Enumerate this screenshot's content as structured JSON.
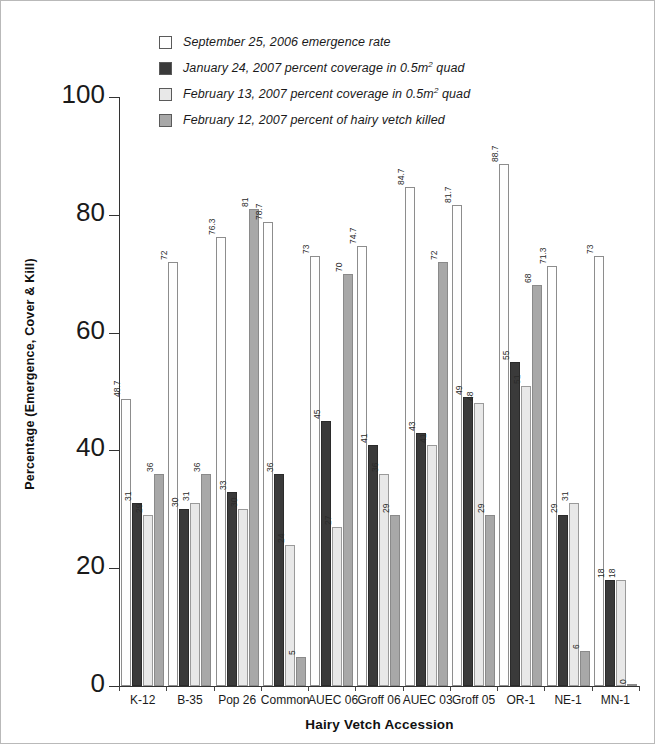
{
  "chart_data": {
    "type": "bar",
    "title": "",
    "xlabel": "Hairy Vetch Accession",
    "ylabel": "Percentage (Emergence, Cover & Kill)",
    "ylim": [
      0,
      100
    ],
    "yticks": [
      0,
      20,
      40,
      60,
      80,
      100
    ],
    "grid": false,
    "legend_position": "top-left",
    "categories": [
      "K-12",
      "B-35",
      "Pop 26",
      "Common",
      "AUEC 06",
      "Groff 06",
      "AUEC 03",
      "Groff 05",
      "OR-1",
      "NE-1",
      "MN-1"
    ],
    "series": [
      {
        "name": "September 25, 2006 emergence rate",
        "color": "#fefefe",
        "values": [
          48.7,
          72,
          76.3,
          78.7,
          73,
          74.7,
          84.7,
          81.7,
          88.7,
          71.3,
          73
        ],
        "labels": [
          "48.7",
          "72",
          "76.3",
          "78.7",
          "73",
          "74.7",
          "84.7",
          "81.7",
          "88.7",
          "71.3",
          "73"
        ]
      },
      {
        "name": "January 24, 2007 percent coverage in 0.5m2 quad",
        "color": "#3a3a3a",
        "values": [
          31,
          30,
          33,
          36,
          45,
          41,
          43,
          49,
          55,
          29,
          18
        ],
        "labels": [
          "31",
          "30",
          "33",
          "36",
          "45",
          "41",
          "43",
          "49",
          "55",
          "29",
          "18"
        ]
      },
      {
        "name": "February 13, 2007 percent coverage in 0.5m2 quad",
        "color": "#e8e8e8",
        "values": [
          29,
          31,
          30,
          24,
          27,
          36,
          41,
          48,
          51,
          31,
          18
        ],
        "labels": [
          "29",
          "31",
          "30",
          "24",
          "27",
          "36",
          "41",
          "48",
          "51",
          "31",
          "18"
        ]
      },
      {
        "name": "February 12, 2007 percent of hairy vetch killed",
        "color": "#a8a8a8",
        "values": [
          36,
          36,
          81,
          5,
          70,
          29,
          72,
          29,
          68,
          6,
          0
        ],
        "labels": [
          "36",
          "36",
          "81",
          "5",
          "70",
          "29",
          "72",
          "29",
          "68",
          "6",
          "0"
        ]
      }
    ]
  },
  "legend": {
    "items": [
      {
        "label_pre": "September 25, 2006 emergence rate",
        "sup": "",
        "label_post": "",
        "swatch": "#fefefe"
      },
      {
        "label_pre": "January 24, 2007 percent coverage in 0.5m",
        "sup": "2",
        "label_post": " quad",
        "swatch": "#3a3a3a"
      },
      {
        "label_pre": "February 13, 2007 percent coverage in 0.5m",
        "sup": "2",
        "label_post": " quad",
        "swatch": "#e8e8e8"
      },
      {
        "label_pre": "February 12, 2007 percent of hairy vetch killed",
        "sup": "",
        "label_post": "",
        "swatch": "#a8a8a8"
      }
    ]
  },
  "axes": {
    "y_title": "Percentage (Emergence, Cover & Kill)",
    "x_title": "Hairy Vetch Accession",
    "y_ticks": [
      "100",
      "80",
      "60",
      "40",
      "20",
      "0"
    ]
  }
}
